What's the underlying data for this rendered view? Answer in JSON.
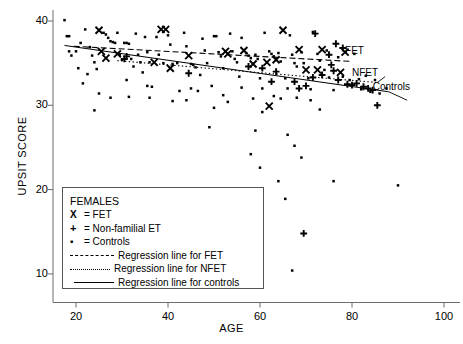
{
  "chart_data": {
    "type": "scatter",
    "title": "",
    "xlabel": "AGE",
    "ylabel": "UPSIT SCORE",
    "xlim": [
      16,
      100
    ],
    "ylim": [
      8,
      41
    ],
    "xticks": [
      20,
      40,
      60,
      80,
      100
    ],
    "yticks": [
      10,
      20,
      30,
      40
    ],
    "grid": false,
    "legend_position": "lower-left-inside",
    "legend_title": "FEMALES",
    "legend_entries": [
      {
        "key": "X",
        "marker": "x",
        "label": "= FET"
      },
      {
        "key": "+",
        "marker": "plus",
        "label": "= Non-familial ET"
      },
      {
        "key": "*",
        "marker": "asterisk",
        "label": "= Controls"
      },
      {
        "key": "dashed",
        "marker": "line-dashed",
        "label": "Regression line for FET"
      },
      {
        "key": "dotted",
        "marker": "line-dotted",
        "label": "Regression line for NFET"
      },
      {
        "key": "solid",
        "marker": "line-solid",
        "label": "Regression line for controls"
      }
    ],
    "annotations": [
      {
        "text": "FET",
        "x": 78.5,
        "y": 36.3
      },
      {
        "text": "NFET",
        "x": 80.0,
        "y": 33.7
      },
      {
        "text": "Controls",
        "x": 84.5,
        "y": 32.0
      }
    ],
    "series": [
      {
        "name": "FET",
        "marker": "x",
        "color": "#000000",
        "points": [
          [
            25,
            38.9
          ],
          [
            25.5,
            36.4
          ],
          [
            26.5,
            35.6
          ],
          [
            29,
            36.1
          ],
          [
            37,
            35.1
          ],
          [
            38.5,
            39.0
          ],
          [
            39.5,
            39.0
          ],
          [
            40.5,
            34.4
          ],
          [
            44.5,
            35.9
          ],
          [
            52.5,
            36.4
          ],
          [
            53,
            36.1
          ],
          [
            56.5,
            36.5
          ],
          [
            58.5,
            34.9
          ],
          [
            61.5,
            35.1
          ],
          [
            62,
            29.9
          ],
          [
            63.5,
            35.4
          ],
          [
            65,
            38.9
          ],
          [
            68.5,
            36.6
          ],
          [
            70,
            34.2
          ],
          [
            72.5,
            34.2
          ],
          [
            73.5,
            36.6
          ],
          [
            77.5,
            33.9
          ],
          [
            78.5,
            36.3
          ]
        ]
      },
      {
        "name": "NFET",
        "marker": "plus",
        "color": "#000000",
        "points": [
          [
            30.5,
            35.5
          ],
          [
            31,
            35.8
          ],
          [
            44.5,
            33.8
          ],
          [
            57.5,
            34.6
          ],
          [
            60.5,
            34.4
          ],
          [
            62.5,
            32.8
          ],
          [
            63.5,
            34.0
          ],
          [
            67.5,
            32.8
          ],
          [
            68.5,
            32.0
          ],
          [
            69.5,
            14.8
          ],
          [
            70,
            32.3
          ],
          [
            71.5,
            33.3
          ],
          [
            72,
            38.5
          ],
          [
            73.5,
            33.6
          ],
          [
            75,
            36.0
          ],
          [
            75.5,
            34.8
          ],
          [
            76,
            34.1
          ],
          [
            76.5,
            37.3
          ],
          [
            77,
            33.0
          ],
          [
            78,
            36.8
          ],
          [
            79,
            32.5
          ],
          [
            80,
            32.4
          ],
          [
            81,
            32.6
          ],
          [
            82.5,
            32.2
          ],
          [
            83.5,
            32.0
          ],
          [
            84.5,
            31.8
          ],
          [
            85.5,
            30.0
          ]
        ]
      },
      {
        "name": "Controls",
        "marker": "asterisk",
        "color": "#000000",
        "points": [
          [
            17.5,
            40.1
          ],
          [
            18.0,
            38.2
          ],
          [
            18.5,
            38.2
          ],
          [
            18.5,
            36.4
          ],
          [
            19.0,
            35.9
          ],
          [
            20.0,
            36.4
          ],
          [
            20.5,
            34.4
          ],
          [
            21.5,
            32.6
          ],
          [
            22.0,
            39.0
          ],
          [
            23.0,
            36.9
          ],
          [
            23.5,
            35.9
          ],
          [
            24.0,
            35.1
          ],
          [
            24.5,
            34.3
          ],
          [
            25.0,
            31.4
          ],
          [
            26.0,
            38.6
          ],
          [
            26.5,
            38.4
          ],
          [
            27.0,
            38.0
          ],
          [
            27.5,
            37.6
          ],
          [
            28.0,
            37.5
          ],
          [
            28.5,
            37.4
          ],
          [
            29.0,
            38.6
          ],
          [
            29.5,
            36.0
          ],
          [
            30.0,
            35.4
          ],
          [
            30.5,
            37.4
          ],
          [
            31.0,
            37.4
          ],
          [
            31.5,
            37.3
          ],
          [
            32.0,
            35.5
          ],
          [
            32.5,
            34.6
          ],
          [
            33.0,
            38.5
          ],
          [
            33.5,
            36.0
          ],
          [
            34.0,
            35.1
          ],
          [
            34.5,
            33.9
          ],
          [
            35.0,
            38.1
          ],
          [
            35.5,
            36.3
          ],
          [
            36.0,
            35.1
          ],
          [
            36.5,
            32.2
          ],
          [
            37.5,
            38.1
          ],
          [
            38.0,
            36.0
          ],
          [
            39.0,
            35.0
          ],
          [
            40.0,
            38.3
          ],
          [
            40.5,
            37.2
          ],
          [
            41.0,
            34.9
          ],
          [
            42.0,
            35.0
          ],
          [
            42.5,
            31.7
          ],
          [
            43.5,
            38.6
          ],
          [
            44.0,
            37.0
          ],
          [
            45.0,
            34.9
          ],
          [
            45.5,
            34.8
          ],
          [
            46.0,
            34.5
          ],
          [
            46.5,
            31.7
          ],
          [
            47.5,
            37.9
          ],
          [
            48.0,
            36.5
          ],
          [
            48.5,
            35.0
          ],
          [
            49.0,
            27.4
          ],
          [
            50.0,
            38.2
          ],
          [
            50.5,
            38.2
          ],
          [
            51.0,
            36.3
          ],
          [
            51.5,
            35.8
          ],
          [
            52.0,
            34.4
          ],
          [
            53.5,
            38.5
          ],
          [
            54.0,
            36.4
          ],
          [
            54.5,
            35.5
          ],
          [
            55.0,
            35.1
          ],
          [
            55.5,
            33.4
          ],
          [
            56.0,
            38.0
          ],
          [
            57.0,
            36.2
          ],
          [
            57.5,
            35.9
          ],
          [
            58.0,
            35.6
          ],
          [
            59.0,
            36.0
          ],
          [
            59.5,
            35.5
          ],
          [
            60.0,
            33.2
          ],
          [
            60.5,
            32.0
          ],
          [
            61.0,
            38.6
          ],
          [
            62.0,
            36.4
          ],
          [
            62.5,
            36.1
          ],
          [
            63.0,
            35.8
          ],
          [
            64.0,
            36.2
          ],
          [
            64.5,
            35.2
          ],
          [
            65.5,
            33.2
          ],
          [
            66.0,
            32.0
          ],
          [
            66.5,
            38.3
          ],
          [
            67.0,
            36.0
          ],
          [
            67.5,
            35.0
          ],
          [
            68.0,
            34.6
          ],
          [
            69.0,
            36.3
          ],
          [
            69.5,
            35.0
          ],
          [
            70.5,
            33.2
          ],
          [
            71.0,
            31.9
          ],
          [
            71.5,
            38.7
          ],
          [
            72.5,
            36.1
          ],
          [
            73.0,
            35.3
          ],
          [
            74.0,
            34.2
          ],
          [
            74.5,
            36.5
          ],
          [
            75.0,
            33.3
          ],
          [
            76.0,
            31.8
          ],
          [
            77.0,
            35.7
          ],
          [
            78.0,
            33.4
          ],
          [
            79.5,
            33.0
          ],
          [
            80.5,
            36.1
          ],
          [
            81.5,
            33.1
          ],
          [
            82.0,
            31.9
          ],
          [
            83.0,
            33.5
          ],
          [
            84.0,
            31.6
          ],
          [
            85.0,
            33.0
          ],
          [
            86.0,
            31.4
          ],
          [
            87.5,
            32.0
          ],
          [
            90.0,
            20.5
          ],
          [
            24.0,
            29.4
          ],
          [
            27.5,
            30.9
          ],
          [
            31.5,
            31.0
          ],
          [
            36.0,
            30.9
          ],
          [
            41.0,
            30.5
          ],
          [
            44.0,
            30.6
          ],
          [
            50.0,
            29.7
          ],
          [
            53.0,
            30.4
          ],
          [
            58.5,
            30.8
          ],
          [
            60.5,
            29.2
          ],
          [
            64.5,
            30.8
          ],
          [
            68.0,
            30.9
          ],
          [
            71.0,
            30.6
          ],
          [
            73.0,
            29.5
          ],
          [
            31.0,
            33.0
          ],
          [
            35.5,
            32.3
          ],
          [
            47.0,
            33.6
          ],
          [
            49.5,
            32.3
          ],
          [
            56.0,
            32.1
          ],
          [
            63.0,
            31.1
          ],
          [
            66.0,
            26.5
          ],
          [
            67.5,
            25.2
          ],
          [
            69.0,
            23.8
          ],
          [
            58.0,
            24.2
          ],
          [
            60.0,
            22.6
          ],
          [
            64.0,
            21.0
          ],
          [
            65.5,
            18.9
          ],
          [
            67.0,
            10.4
          ],
          [
            76.0,
            21.0
          ],
          [
            21.0,
            37.4
          ],
          [
            22.5,
            33.7
          ],
          [
            45.0,
            32.0
          ],
          [
            52.0,
            31.2
          ],
          [
            59.0,
            27.0
          ]
        ]
      }
    ],
    "regression_lines": [
      {
        "name": "FET",
        "style": "dashed",
        "x0": 19.5,
        "y0": 37.0,
        "x1": 80.0,
        "y1": 35.2
      },
      {
        "name": "NFET",
        "style": "dotted",
        "x0": 29.0,
        "y0": 35.3,
        "x1": 85.5,
        "y1": 32.7
      },
      {
        "name": "Controls",
        "style": "solid",
        "x0": 17.5,
        "y0": 37.1,
        "x1": 88.0,
        "y1": 31.6
      }
    ]
  }
}
